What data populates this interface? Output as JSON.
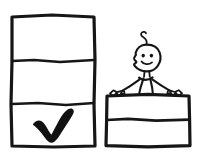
{
  "image": {
    "title": "Checklist panel and stick figure at ledge",
    "style": "hand-drawn ink sketch",
    "background_color": "#ffffff",
    "ink_color": "#161616",
    "width": 205,
    "height": 162
  },
  "left_panel": {
    "name": "checklist-box",
    "description": "Tall rectangle divided into three stacked rows",
    "rows": [
      {
        "index": 1,
        "content": "empty",
        "label": ""
      },
      {
        "index": 2,
        "content": "empty",
        "label": ""
      },
      {
        "index": 3,
        "content": "checkmark",
        "label": ""
      }
    ],
    "row_count": 3,
    "checked_row": 3,
    "check_icon": "check-mark"
  },
  "right_panel": {
    "name": "ledge-box",
    "description": "Wide rectangle divided into two stacked rows, figure standing behind it",
    "rows": [
      {
        "index": 1,
        "content": "empty",
        "label": ""
      },
      {
        "index": 2,
        "content": "empty",
        "label": ""
      }
    ],
    "row_count": 2
  },
  "figure": {
    "name": "stick-figure",
    "expression": "smiling",
    "features": [
      "hair-curl",
      "left-eye",
      "right-eye",
      "smile",
      "neck",
      "torso",
      "left-arm",
      "right-arm",
      "left-hand",
      "right-hand",
      "hips",
      "left-leg",
      "right-leg",
      "feet"
    ]
  }
}
